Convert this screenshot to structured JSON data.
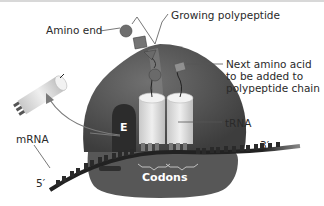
{
  "diagram": {
    "labels": {
      "amino_end": "Amino end",
      "growing_polypeptide": "Growing polypeptide",
      "next_amino_acid": "Next amino acid\nto be added to\npolypeptide chain",
      "trna": "tRNA",
      "mrna": "mRNA",
      "five_prime": "5′",
      "three_prime": "3′",
      "e_site": "E",
      "codons": "Codons"
    },
    "colors": {
      "ribosome_large": "#5e5e5e",
      "ribosome_dark": "#3f3f3f",
      "ribosome_small": "#5a5a5a",
      "e_site": "#2e2e2e",
      "trna_body": "#d9d9d9",
      "trna_light": "#eeeeee",
      "mrna": "#222222",
      "amino_acid": "#707070",
      "leader_line": "#555555",
      "arrow": "#777777"
    }
  }
}
